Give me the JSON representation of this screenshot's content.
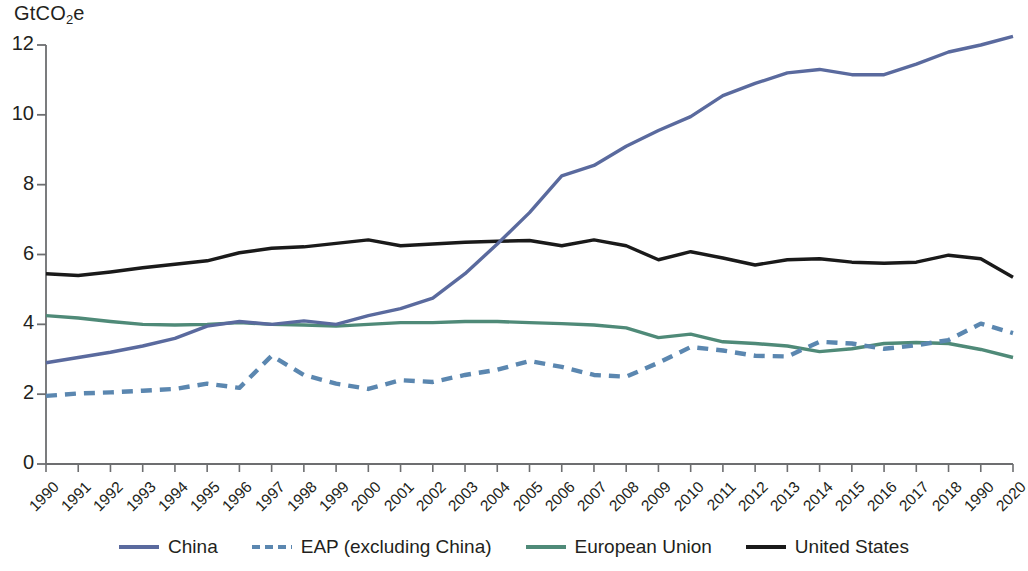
{
  "axis": {
    "unit_label_text": "GtCO",
    "unit_label_sub": "2",
    "unit_label_tail": "e",
    "y_ticks": [
      "0",
      "2",
      "4",
      "6",
      "8",
      "10",
      "12"
    ],
    "x_ticks": [
      "1990",
      "1991",
      "1992",
      "1993",
      "1994",
      "1995",
      "1996",
      "1997",
      "1998",
      "1999",
      "2000",
      "2001",
      "2002",
      "2003",
      "2004",
      "2005",
      "2006",
      "2007",
      "2008",
      "2009",
      "2010",
      "2011",
      "2012",
      "2013",
      "2014",
      "2015",
      "2016",
      "2017",
      "2018",
      "1990",
      "2020"
    ]
  },
  "legend": {
    "items": [
      {
        "label": "China",
        "color": "#5a6a9e",
        "style": "solid"
      },
      {
        "label": "EAP (excluding China)",
        "color": "#5b87b0",
        "style": "dashed"
      },
      {
        "label": "European Union",
        "color": "#4f8a78",
        "style": "solid"
      },
      {
        "label": "United States",
        "color": "#1a1a1a",
        "style": "solid"
      }
    ]
  },
  "chart_data": {
    "type": "line",
    "title": "",
    "xlabel": "",
    "ylabel": "GtCO2e",
    "ylim": [
      0,
      12.6
    ],
    "grid": false,
    "legend_position": "bottom",
    "categories": [
      "1990",
      "1991",
      "1992",
      "1993",
      "1994",
      "1995",
      "1996",
      "1997",
      "1998",
      "1999",
      "2000",
      "2001",
      "2002",
      "2003",
      "2004",
      "2005",
      "2006",
      "2007",
      "2008",
      "2009",
      "2010",
      "2011",
      "2012",
      "2013",
      "2014",
      "2015",
      "2016",
      "2017",
      "2018",
      "2019",
      "2020"
    ],
    "series": [
      {
        "name": "China",
        "color": "#5a6a9e",
        "style": "solid",
        "values": [
          2.9,
          3.05,
          3.2,
          3.38,
          3.6,
          3.95,
          4.08,
          4.0,
          4.1,
          4.0,
          4.25,
          4.45,
          4.75,
          5.45,
          6.3,
          7.2,
          8.25,
          8.55,
          9.1,
          9.55,
          9.95,
          10.55,
          10.9,
          11.2,
          11.3,
          11.15,
          11.15,
          11.45,
          11.8,
          12.0,
          12.25
        ]
      },
      {
        "name": "EAP (excluding China)",
        "color": "#5b87b0",
        "style": "dashed",
        "values": [
          1.95,
          2.02,
          2.05,
          2.1,
          2.15,
          2.3,
          2.18,
          3.1,
          2.55,
          2.3,
          2.15,
          2.4,
          2.35,
          2.55,
          2.7,
          2.95,
          2.78,
          2.55,
          2.5,
          2.9,
          3.35,
          3.25,
          3.1,
          3.08,
          3.5,
          3.45,
          3.3,
          3.4,
          3.55,
          4.02,
          3.75
        ]
      },
      {
        "name": "European Union",
        "color": "#4f8a78",
        "style": "solid",
        "values": [
          4.25,
          4.18,
          4.08,
          4.0,
          3.98,
          4.0,
          4.05,
          4.0,
          3.98,
          3.95,
          4.0,
          4.05,
          4.05,
          4.08,
          4.08,
          4.05,
          4.02,
          3.98,
          3.9,
          3.62,
          3.72,
          3.5,
          3.45,
          3.38,
          3.22,
          3.3,
          3.45,
          3.48,
          3.45,
          3.28,
          3.05
        ]
      },
      {
        "name": "United States",
        "color": "#1a1a1a",
        "style": "solid",
        "values": [
          5.45,
          5.4,
          5.5,
          5.62,
          5.72,
          5.82,
          6.05,
          6.18,
          6.22,
          6.32,
          6.42,
          6.25,
          6.3,
          6.35,
          6.38,
          6.4,
          6.25,
          6.42,
          6.25,
          5.85,
          6.08,
          5.9,
          5.7,
          5.85,
          5.88,
          5.78,
          5.75,
          5.78,
          5.98,
          5.88,
          5.35
        ]
      }
    ]
  }
}
